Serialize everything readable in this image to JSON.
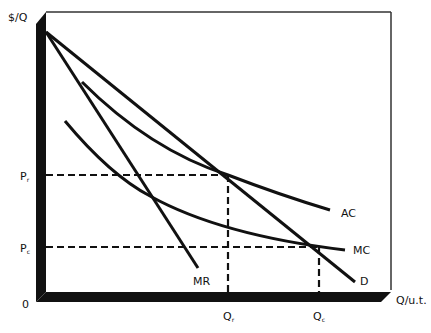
{
  "diagram": {
    "type": "economics-monopoly-regulation",
    "axes": {
      "y_label": "$/Q",
      "x_label": "Q/u.t.",
      "origin_label": "0"
    },
    "price_levels": [
      {
        "name": "Pr",
        "letter": "P",
        "subscript": "r",
        "y_px": 175
      },
      {
        "name": "Pc",
        "letter": "P",
        "subscript": "c",
        "y_px": 247
      }
    ],
    "quantity_levels": [
      {
        "name": "Qr",
        "letter": "Q",
        "subscript": "r",
        "x_px": 228
      },
      {
        "name": "Qc",
        "letter": "Q",
        "subscript": "c",
        "x_px": 319
      }
    ],
    "curves": [
      {
        "name": "D",
        "label": "D",
        "shape": "line"
      },
      {
        "name": "MR",
        "label": "MR",
        "shape": "line"
      },
      {
        "name": "AC",
        "label": "AC",
        "shape": "convex-curve"
      },
      {
        "name": "MC",
        "label": "MC",
        "shape": "convex-curve"
      }
    ],
    "colors": {
      "line": "#111111",
      "background": "#ffffff",
      "frame": "#333333"
    }
  }
}
